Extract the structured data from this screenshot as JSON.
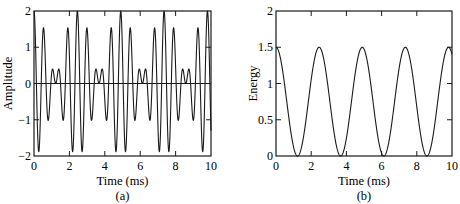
{
  "chart_data": [
    {
      "type": "line",
      "panel_label": "(a)",
      "title": "",
      "xlabel": "Time (ms)",
      "ylabel": "Amplitude",
      "xlim": [
        0,
        10
      ],
      "ylim": [
        -2,
        2
      ],
      "xticks": [
        0,
        2,
        4,
        6,
        8,
        10
      ],
      "yticks": [
        -2,
        -1,
        0,
        1,
        2
      ],
      "xtick_labels": [
        "0",
        "2",
        "4",
        "6",
        "8",
        "10"
      ],
      "ytick_labels": [
        "−2",
        "−1",
        "0",
        "1",
        "2"
      ],
      "grid": false,
      "zero_line": true,
      "series": [
        {
          "name": "signal",
          "description": "Sum of two cosines: cos(2π·4t/T) + cos(2π·5t/T), T ≈ 2.45 ms",
          "period_ms": 2.45,
          "x": [
            0,
            0.6,
            1.0,
            1.3,
            1.6,
            2.05,
            2.45,
            3.0,
            3.4,
            3.7,
            4.0,
            4.45,
            4.9,
            5.45,
            5.85,
            6.15,
            6.45,
            6.9,
            7.35,
            7.9,
            8.3,
            8.6,
            8.9,
            9.35,
            9.8,
            10
          ],
          "values": [
            2,
            -1.6,
            0.7,
            0.05,
            0.7,
            -1.6,
            2,
            -1.6,
            0.7,
            0.05,
            0.7,
            -1.6,
            2,
            -1.6,
            0.7,
            0.05,
            0.7,
            -1.6,
            2,
            -1.6,
            0.7,
            0.05,
            0.7,
            -1.6,
            2,
            0
          ]
        }
      ]
    },
    {
      "type": "line",
      "panel_label": "(b)",
      "title": "",
      "xlabel": "Time (ms)",
      "ylabel": "Energy",
      "xlim": [
        0,
        10
      ],
      "ylim": [
        0,
        2
      ],
      "xticks": [
        0,
        2,
        4,
        6,
        8,
        10
      ],
      "yticks": [
        0,
        0.5,
        1,
        1.5,
        2
      ],
      "xtick_labels": [
        "0",
        "2",
        "4",
        "6",
        "8",
        "10"
      ],
      "ytick_labels": [
        "0",
        "0.5",
        "1",
        "1.5",
        "2"
      ],
      "grid": false,
      "series": [
        {
          "name": "energy",
          "description": "Raised-cosine energy envelope, 0 to 1.5, period ≈ 2.45 ms",
          "period_ms": 2.45,
          "x": [
            0,
            1.22,
            2.45,
            3.67,
            4.9,
            6.12,
            7.35,
            8.57,
            9.8,
            10
          ],
          "values": [
            1.5,
            0,
            1.5,
            0,
            1.5,
            0,
            1.5,
            0,
            1.5,
            1.25
          ]
        }
      ]
    }
  ]
}
